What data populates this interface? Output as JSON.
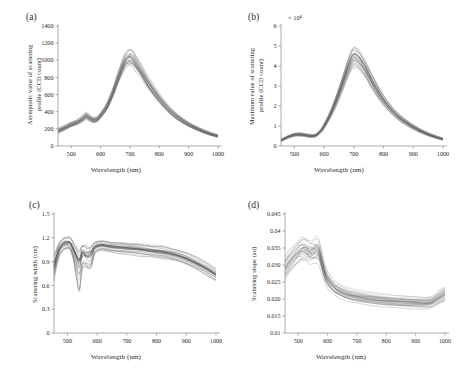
{
  "figure": {
    "background": "#ffffff",
    "axis_color": "#8a8a8a",
    "curve_color": "#4a4a4a",
    "panels": [
      "a",
      "b",
      "c",
      "d"
    ]
  },
  "panel_a": {
    "label": "(a)",
    "ylabel_line1": "Asymptotic value of scattering",
    "ylabel_line2": "profile (CCD count)",
    "xlabel": "Wavelength (nm)"
  },
  "panel_b": {
    "label": "(b)",
    "ylabel_line1": "Maximum value of scattering",
    "ylabel_line2": "profile (CCD count)",
    "xlabel": "Wavelength (nm)",
    "exponent": "× 10⁴"
  },
  "panel_c": {
    "label": "(c)",
    "ylabel": "Scattering width (cm)",
    "xlabel": "Wavelength (nm)"
  },
  "panel_d": {
    "label": "(d)",
    "ylabel": "Scattering slope (au)",
    "xlabel": "Wavelength (nm)"
  },
  "chart_data": [
    {
      "id": "a",
      "type": "line",
      "title": "(a)",
      "xlabel": "Wavelength (nm)",
      "ylabel": "Asymptotic value of scattering profile (CCD count)",
      "xlim": [
        455,
        1000
      ],
      "ylim": [
        0,
        1400
      ],
      "xticks": [
        500,
        600,
        700,
        800,
        900,
        1000
      ],
      "yticks": [
        0,
        200,
        400,
        600,
        800,
        1000,
        1200,
        1400
      ],
      "grid": false,
      "legend": "none",
      "n_curves": 34,
      "x": [
        455,
        480,
        500,
        520,
        540,
        550,
        560,
        575,
        590,
        600,
        620,
        640,
        660,
        680,
        690,
        700,
        710,
        720,
        740,
        760,
        780,
        800,
        830,
        860,
        900,
        940,
        970,
        1000
      ],
      "mean_values": [
        175,
        215,
        250,
        275,
        320,
        345,
        330,
        300,
        315,
        355,
        450,
        600,
        790,
        960,
        1010,
        1030,
        1010,
        960,
        855,
        740,
        640,
        550,
        430,
        340,
        250,
        185,
        145,
        115
      ],
      "spread_frac": [
        0.3,
        0.24,
        0.2,
        0.19,
        0.2,
        0.21,
        0.2,
        0.19,
        0.18,
        0.17,
        0.16,
        0.16,
        0.16,
        0.17,
        0.17,
        0.17,
        0.17,
        0.17,
        0.17,
        0.17,
        0.17,
        0.17,
        0.17,
        0.18,
        0.19,
        0.2,
        0.21,
        0.23
      ]
    },
    {
      "id": "b",
      "type": "line",
      "title": "(b)",
      "xlabel": "Wavelength (nm)",
      "ylabel": "Maximum value of scattering profile (CCD count)",
      "exponent": "× 10⁴",
      "xlim": [
        455,
        1000
      ],
      "ylim": [
        0,
        6
      ],
      "xticks": [
        500,
        600,
        700,
        800,
        900,
        1000
      ],
      "yticks": [
        0,
        1,
        2,
        3,
        4,
        5,
        6
      ],
      "grid": false,
      "legend": "none",
      "n_curves": 34,
      "x": [
        455,
        480,
        500,
        515,
        530,
        545,
        560,
        575,
        590,
        600,
        620,
        640,
        660,
        675,
        690,
        700,
        710,
        720,
        740,
        760,
        780,
        800,
        830,
        860,
        900,
        940,
        970,
        1000
      ],
      "mean_values": [
        0.28,
        0.46,
        0.56,
        0.58,
        0.56,
        0.52,
        0.5,
        0.56,
        0.78,
        1.0,
        1.55,
        2.25,
        3.05,
        3.7,
        4.25,
        4.45,
        4.4,
        4.25,
        3.8,
        3.25,
        2.75,
        2.3,
        1.75,
        1.35,
        0.95,
        0.65,
        0.48,
        0.34
      ],
      "spread_frac": [
        0.34,
        0.24,
        0.22,
        0.22,
        0.22,
        0.22,
        0.22,
        0.21,
        0.2,
        0.2,
        0.19,
        0.19,
        0.19,
        0.19,
        0.19,
        0.19,
        0.19,
        0.19,
        0.19,
        0.19,
        0.19,
        0.19,
        0.19,
        0.2,
        0.21,
        0.22,
        0.23,
        0.25
      ]
    },
    {
      "id": "c",
      "type": "line",
      "title": "(c)",
      "xlabel": "Wavelength (nm)",
      "ylabel": "Scattering width (cm)",
      "xlim": [
        455,
        1000
      ],
      "ylim": [
        0,
        1.5
      ],
      "xticks": [
        500,
        600,
        700,
        800,
        900,
        1000
      ],
      "yticks": [
        0,
        0.3,
        0.6,
        0.9,
        1.2,
        1.5
      ],
      "grid": false,
      "legend": "none",
      "n_curves": 32,
      "x": [
        455,
        470,
        485,
        500,
        510,
        520,
        530,
        540,
        550,
        560,
        570,
        580,
        590,
        600,
        615,
        630,
        650,
        680,
        710,
        740,
        780,
        820,
        860,
        900,
        940,
        970,
        1000
      ],
      "mean_values": [
        0.92,
        1.06,
        1.11,
        1.13,
        1.12,
        1.05,
        1.0,
        0.97,
        1.04,
        0.99,
        1.02,
        1.06,
        1.08,
        1.09,
        1.1,
        1.09,
        1.08,
        1.07,
        1.06,
        1.05,
        1.03,
        1.01,
        0.98,
        0.93,
        0.86,
        0.8,
        0.73
      ],
      "spread_frac": [
        0.26,
        0.15,
        0.12,
        0.11,
        0.12,
        0.16,
        0.18,
        0.2,
        0.16,
        0.19,
        0.16,
        0.13,
        0.11,
        0.1,
        0.1,
        0.1,
        0.1,
        0.11,
        0.11,
        0.12,
        0.12,
        0.13,
        0.13,
        0.14,
        0.15,
        0.16,
        0.17
      ],
      "notes": "Hemoglobin absorption dips near 540 and 575 nm; low outlier curves reach ~0.45"
    },
    {
      "id": "d",
      "type": "line",
      "title": "(d)",
      "xlabel": "Wavelength (nm)",
      "ylabel": "Scattering slope (au)",
      "xlim": [
        455,
        1000
      ],
      "ylim": [
        0.01,
        0.045
      ],
      "xticks": [
        500,
        600,
        700,
        800,
        900,
        1000
      ],
      "yticks": [
        0.01,
        0.015,
        0.02,
        0.025,
        0.03,
        0.035,
        0.04,
        0.045
      ],
      "grid": false,
      "legend": "none",
      "n_curves": 32,
      "x": [
        455,
        470,
        485,
        500,
        510,
        520,
        530,
        540,
        550,
        560,
        570,
        580,
        590,
        600,
        620,
        640,
        670,
        700,
        740,
        780,
        820,
        860,
        900,
        930,
        955,
        975,
        1000
      ],
      "mean_values": [
        0.0292,
        0.031,
        0.0325,
        0.0338,
        0.0345,
        0.0347,
        0.0342,
        0.0338,
        0.034,
        0.0345,
        0.034,
        0.031,
        0.0278,
        0.0258,
        0.0236,
        0.0224,
        0.0213,
        0.0207,
        0.0201,
        0.0197,
        0.0194,
        0.0192,
        0.019,
        0.0189,
        0.0192,
        0.0203,
        0.0215
      ],
      "spread_frac": [
        0.17,
        0.15,
        0.14,
        0.14,
        0.14,
        0.14,
        0.14,
        0.14,
        0.14,
        0.14,
        0.14,
        0.14,
        0.13,
        0.13,
        0.12,
        0.12,
        0.12,
        0.12,
        0.12,
        0.12,
        0.12,
        0.12,
        0.12,
        0.12,
        0.12,
        0.13,
        0.14
      ],
      "notes": "Peak near 515-560 nm, monotone decline to ~900 nm, upturn after 950 nm"
    }
  ]
}
